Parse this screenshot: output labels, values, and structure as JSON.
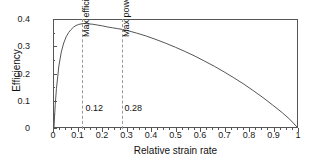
{
  "chart_data": {
    "type": "line",
    "title": "",
    "xlabel": "Relative strain rate",
    "ylabel": "Efficiency",
    "xlim": [
      0,
      1
    ],
    "ylim": [
      0,
      0.4
    ],
    "grid": false,
    "legend": null,
    "xticks": [
      "0",
      "0.1",
      "0.2",
      "0.3",
      "0.4",
      "0.5",
      "0.6",
      "0.7",
      "0.8",
      "0.9",
      "1"
    ],
    "xtick_values": [
      0,
      0.1,
      0.2,
      0.3,
      0.4,
      0.5,
      0.6,
      0.7,
      0.8,
      0.9,
      1
    ],
    "yticks": [
      "0",
      "0.1",
      "0.2",
      "0.3",
      "0.4"
    ],
    "ytick_values": [
      0,
      0.1,
      0.2,
      0.3,
      0.4
    ],
    "x_minor_step": 0.025,
    "y_minor_step": 0.05,
    "series": [
      {
        "name": "Efficiency",
        "color": "#555555",
        "x": [
          0,
          0.005,
          0.01,
          0.02,
          0.03,
          0.04,
          0.05,
          0.06,
          0.07,
          0.08,
          0.09,
          0.1,
          0.12,
          0.14,
          0.16,
          0.18,
          0.2,
          0.22,
          0.24,
          0.26,
          0.28,
          0.3,
          0.34,
          0.38,
          0.42,
          0.46,
          0.5,
          0.54,
          0.58,
          0.62,
          0.66,
          0.7,
          0.74,
          0.78,
          0.82,
          0.86,
          0.9,
          0.94,
          0.97,
          1
        ],
        "y": [
          0,
          0.083,
          0.143,
          0.228,
          0.28,
          0.314,
          0.337,
          0.353,
          0.364,
          0.373,
          0.379,
          0.383,
          0.387,
          0.386,
          0.384,
          0.381,
          0.378,
          0.374,
          0.371,
          0.368,
          0.365,
          0.361,
          0.351,
          0.34,
          0.327,
          0.313,
          0.298,
          0.282,
          0.265,
          0.246,
          0.227,
          0.206,
          0.184,
          0.161,
          0.136,
          0.11,
          0.082,
          0.053,
          0.029,
          0
        ]
      }
    ],
    "annotations": [
      {
        "id": "max-efficiency",
        "label": "Max efficiency",
        "value_label": "0.12",
        "x": 0.12,
        "line_style": "dashed",
        "line_color": "#999999"
      },
      {
        "id": "max-power",
        "label": "Max power",
        "value_label": "0.28",
        "x": 0.28,
        "line_style": "dashed",
        "line_color": "#999999"
      }
    ]
  }
}
